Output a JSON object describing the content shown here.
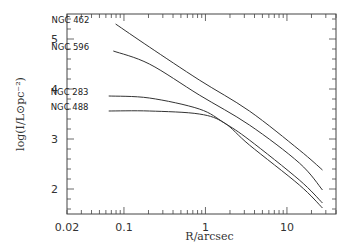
{
  "chart_data": {
    "type": "line",
    "title": "",
    "xlabel": "R/arcsec",
    "ylabel": "log(I/L⊙pc⁻²)",
    "xscale": "log",
    "xlim": [
      0.02,
      40
    ],
    "ylim": [
      1.5,
      5.5
    ],
    "xticks": [
      0.02,
      0.1,
      1,
      10
    ],
    "xtick_labels": [
      "0.02",
      "0.1",
      "1",
      "10"
    ],
    "yticks": [
      2,
      3,
      4,
      5
    ],
    "ytick_labels": [
      "2",
      "3",
      "4",
      "5"
    ],
    "grid": false,
    "legend": "inline labels at curve starts",
    "series": [
      {
        "name": "NGC 462",
        "x": [
          0.079,
          0.205,
          0.84,
          3.46,
          14.2,
          27.3
        ],
        "y": [
          5.3,
          4.84,
          4.18,
          3.56,
          2.78,
          2.38
        ]
      },
      {
        "name": "NGC 596",
        "x": [
          0.074,
          0.205,
          0.84,
          3.46,
          14.2,
          27.3
        ],
        "y": [
          4.76,
          4.5,
          3.88,
          3.28,
          2.52,
          1.98
        ]
      },
      {
        "name": "NGC 283",
        "x": [
          0.065,
          0.205,
          0.84,
          1.71,
          3.46,
          14.2,
          27.3
        ],
        "y": [
          3.86,
          3.82,
          3.6,
          3.32,
          2.98,
          2.18,
          1.72
        ]
      },
      {
        "name": "NGC 488",
        "x": [
          0.065,
          0.205,
          0.84,
          1.71,
          3.46,
          14.2,
          27.3
        ],
        "y": [
          3.56,
          3.56,
          3.5,
          3.32,
          2.88,
          2.08,
          1.62
        ]
      }
    ]
  },
  "plot": {
    "line_color": "#333333",
    "frame_color": "#444444"
  }
}
